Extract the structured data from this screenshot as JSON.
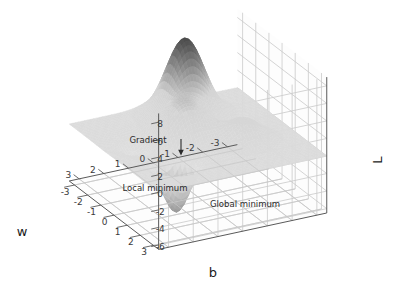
{
  "figure": {
    "kind": "3d-surface-plot",
    "background": "#ffffff",
    "width": 402,
    "height": 298
  },
  "axes": {
    "x": {
      "label": "b",
      "ticks": [
        "-3",
        "-2",
        "-1",
        "0",
        "1",
        "2",
        "3"
      ],
      "range": [
        -3.4,
        3.4
      ]
    },
    "y": {
      "label": "w",
      "ticks": [
        "-3",
        "-2",
        "-1",
        "0",
        "1",
        "2",
        "3"
      ],
      "range": [
        -3.4,
        3.4
      ]
    },
    "z": {
      "label": "L",
      "ticks": [
        "8",
        "6",
        "4",
        "2",
        "0",
        "-2",
        "-4",
        "-6"
      ],
      "range": [
        -6.5,
        9.0
      ]
    }
  },
  "annotations": [
    {
      "name": "gradient",
      "text": "Gradient",
      "has_arrow": true
    },
    {
      "name": "local-minimum",
      "text": "Local minimum",
      "has_arrow": false
    },
    {
      "name": "global-minimum",
      "text": "Global minimum",
      "has_arrow": false
    }
  ],
  "colors": {
    "grid_line": "#c9c9c9",
    "pane_edge": "#b4b4b4",
    "spine": "#5a5a5a",
    "surface_high": "#4e4e4e",
    "surface_mid": "#b9b9b9",
    "surface_low": "#dcdcdc",
    "surface_plane": "#d9d9d9",
    "tick_text": "#3a3a3a",
    "label_text": "#1a1a1a",
    "annotation_text": "#2b2b2b"
  },
  "chart_data": {
    "type": "surface",
    "title": "",
    "xlabel": "b",
    "ylabel": "w",
    "zlabel": "L",
    "xlim": [
      -3.4,
      3.4
    ],
    "ylim": [
      -3.4,
      3.4
    ],
    "zlim": [
      -6.5,
      9.0
    ],
    "grid": true,
    "legend": "none",
    "colormap": "grayscale",
    "projection": {
      "elevation_deg": 24,
      "azimuth_deg": -62
    },
    "features": [
      {
        "name": "tall peak (local maximum)",
        "b": -2.1,
        "w": -0.6,
        "L": 8.6
      },
      {
        "name": "central ridge bump",
        "b": -0.4,
        "w": 0.4,
        "L": 4.2
      },
      {
        "name": "secondary bump",
        "b": 0.9,
        "w": -1.4,
        "L": 2.6
      },
      {
        "name": "local minimum",
        "b": -0.7,
        "w": 1.9,
        "L": -2.2
      },
      {
        "name": "global minimum",
        "b": 1.25,
        "w": 1.55,
        "L": -5.9
      }
    ],
    "surface_function": "L = 3*exp(-((b+2.1)^2+(w+0.6)^2)/0.9) * 2.9 + 2.2*exp(-((b+0.4)^2+(w-0.4)^2)/1.1) + 1.6*exp(-((b-0.9)^2+(w+1.4)^2)/0.7) - 2.6*exp(-((b+0.7)^2+(w-1.9)^2)/0.55) - 6.4*exp(-((b-1.25)^2+(w-1.55)^2)/0.45)",
    "x_ticks": [
      -3,
      -2,
      -1,
      0,
      1,
      2,
      3
    ],
    "y_ticks": [
      -3,
      -2,
      -1,
      0,
      1,
      2,
      3
    ],
    "z_ticks": [
      8,
      6,
      4,
      2,
      0,
      -2,
      -4,
      -6
    ]
  }
}
